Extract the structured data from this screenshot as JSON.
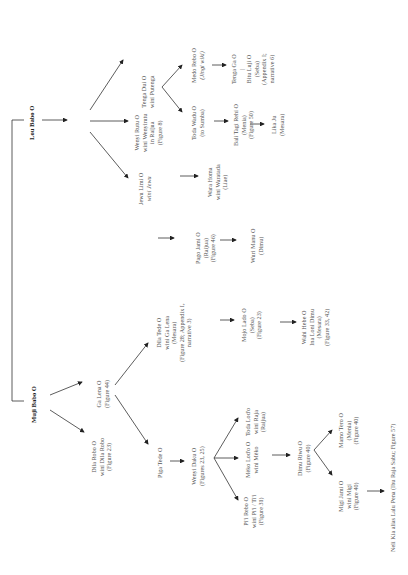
{
  "diagram": {
    "orientation": "rotated-90-ccw",
    "roots": {
      "muji": {
        "lines": [
          "Muji Babo O"
        ]
      },
      "lou": {
        "lines": [
          "Lou Babo O"
        ]
      }
    },
    "muji_children": {
      "dila_robo": {
        "lines": [
          "Dila Robo O",
          "wini Dila Robo",
          "(Figure 23)"
        ]
      },
      "ga_lena": {
        "lines": [
          "Ga Lena O",
          "(Figure 44)"
        ]
      }
    },
    "ga_lena_children": {
      "piga_tede": {
        "lines": [
          "Piga Tede O"
        ]
      },
      "dila_tede": {
        "lines": [
          "Dila Tede O",
          "wini Ga Lena",
          "(Mesara)",
          "(Figure 28; Appendix I,",
          "narrative 3)"
        ]
      }
    },
    "dila_tede_child": {
      "mojo_lado": {
        "lines": [
          "Mojo Lado O",
          "(Seba)",
          "(Figure 23)"
        ]
      }
    },
    "mojo_lado_child": {
      "wahi_hebe": {
        "lines": [
          "Wahi Hebe O",
          "Ina Loni Dimu",
          "(Mesara)",
          "(Figure 33, 42)"
        ]
      }
    },
    "piga_tede_child": {
      "wenyi_daku": {
        "lines": [
          "Wenyi Daku O",
          "(Figures 23, 25)"
        ]
      }
    },
    "wenyi_daku_children": {
      "pii_rebo": {
        "lines": [
          "Pi'i Rebo O",
          "wini Pi'i / Ti'i",
          "(Figure 31)"
        ]
      },
      "meko_lodo": {
        "lines": [
          "Mèko Lod'o O",
          "wini Mèko"
        ]
      },
      "toda_lodo": {
        "lines": [
          "Toda Lod'o",
          "wini Raja",
          "(Raijua)"
        ]
      }
    },
    "meko_lodo_child": {
      "dimu_riwu": {
        "lines": [
          "Dimu Riwu O",
          "(Figure 40)"
        ]
      }
    },
    "dimu_riwu_children": {
      "migi_jami": {
        "lines": [
          "Migi Jami O",
          "wini Migi",
          "(Figure 40)"
        ]
      },
      "mamo_tero": {
        "lines": [
          "Mamo Tero O",
          "(Menia)",
          "(Figure 40)"
        ]
      }
    },
    "migi_jami_child": {
      "neli_kia": {
        "lines": [
          "Neli Kia alias Lalu Pena (Ibu Raja Sabu; Figure 57)"
        ]
      }
    },
    "lou_children": {
      "jewu_limi": {
        "lines": [
          "Jewu Limi O",
          "wini Jewu"
        ]
      },
      "wenyi_rutu": {
        "lines": [
          "Wenyi Rutu O",
          "wini Wenyirutu",
          "in Raijua",
          "(Figure 8)"
        ]
      },
      "tenga_dui": {
        "lines": [
          "Tenga Dui O",
          "wini Putenga"
        ]
      }
    },
    "jewu_limi_child": {
      "pago_jami": {
        "lines": [
          "Pago Jami O",
          "(Raijua)",
          "(Figure 46)"
        ]
      }
    },
    "pago_jami_child": {
      "wuri_manu": {
        "lines": [
          "Wuri Manu O",
          "(Dimu)"
        ]
      }
    },
    "wenyi_rutu_child": {
      "wara_homa": {
        "lines": [
          "Wara Homa",
          "wini Waratada",
          "(Liae)"
        ]
      }
    },
    "tenga_dui_children": {
      "toda_wadu": {
        "lines": [
          "Toda Wadu O",
          "(to Sumba)"
        ]
      },
      "medo_rebo": {
        "lines": [
          "Medo Rebo O",
          "(Jingi wiki)"
        ]
      }
    },
    "toda_wadu_child": {
      "bali_tagi": {
        "lines": [
          "Bali Tagi Rehi O",
          "(Menia)",
          "(Figure 50)"
        ]
      }
    },
    "bali_tagi_child": {
      "lika_ju": {
        "lines": [
          "Lika Ju",
          "(Mesara)"
        ]
      }
    },
    "medo_rebo_child": {
      "tenga_ga": {
        "lines": [
          "Tenga Ga O",
          "|",
          "Bitu Luji O",
          "(Seba)",
          "(Appendix I;",
          "narrative 6)"
        ]
      }
    }
  }
}
